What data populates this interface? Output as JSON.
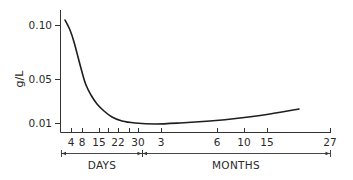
{
  "chart_data": {
    "type": "line",
    "title": "",
    "ylabel": "g/L",
    "xlabel": "",
    "y_ticks": [
      {
        "label": "0.10",
        "value": 0.1,
        "py": 25
      },
      {
        "label": "0.05",
        "value": 0.05,
        "py": 79
      },
      {
        "label": "0.01",
        "value": 0.01,
        "py": 123
      }
    ],
    "x_ticks": [
      {
        "label": "4",
        "px": 71
      },
      {
        "label": "8",
        "px": 82
      },
      {
        "label": "15",
        "px": 99
      },
      {
        "label": "22",
        "px": 118
      },
      {
        "label": "30",
        "px": 138
      },
      {
        "label": "3",
        "px": 161
      },
      {
        "label": "6",
        "px": 217
      },
      {
        "label": "10",
        "px": 244
      },
      {
        "label": "15",
        "px": 267
      },
      {
        "label": "27",
        "px": 330
      }
    ],
    "minor_x_ticks_px": [
      108,
      129
    ],
    "x_groups": [
      {
        "label": "DAYS",
        "from_px": 61,
        "to_px": 142
      },
      {
        "label": "MONTHS",
        "from_px": 142,
        "to_px": 330
      }
    ],
    "series": [
      {
        "name": "concentration",
        "x": [
          "day 3",
          "day 4",
          "day 8",
          "day 15",
          "day 22",
          "day 30",
          "month 3",
          "month 6",
          "month 10",
          "month 15",
          "month 20"
        ],
        "values": [
          0.1,
          0.09,
          0.05,
          0.022,
          0.013,
          0.01,
          0.009,
          0.011,
          0.013,
          0.016,
          0.019
        ]
      }
    ],
    "curve_px": [
      [
        65,
        20
      ],
      [
        70,
        30
      ],
      [
        74,
        42
      ],
      [
        78,
        57
      ],
      [
        82,
        72
      ],
      [
        86,
        85
      ],
      [
        91,
        95
      ],
      [
        97,
        104
      ],
      [
        104,
        111
      ],
      [
        112,
        117
      ],
      [
        122,
        121
      ],
      [
        135,
        123
      ],
      [
        155,
        124
      ],
      [
        180,
        123
      ],
      [
        210,
        121
      ],
      [
        240,
        118
      ],
      [
        270,
        114
      ],
      [
        299,
        109
      ]
    ],
    "grid": false,
    "legend": null
  }
}
